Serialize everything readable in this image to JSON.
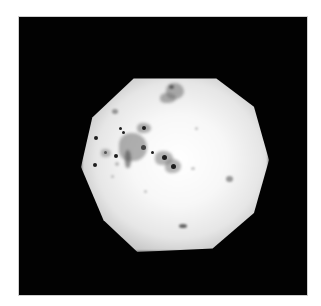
{
  "image": {
    "description": "Micrograph of cells in a bright circular illuminated field on a black background",
    "colors": {
      "background": "#ffffff",
      "frame": "#020202",
      "field_center": "#ffffff",
      "field_edge": "#bdbdbd",
      "nucleus": "#1e1e1e",
      "cytoplasm": "#8a8a8a"
    }
  }
}
